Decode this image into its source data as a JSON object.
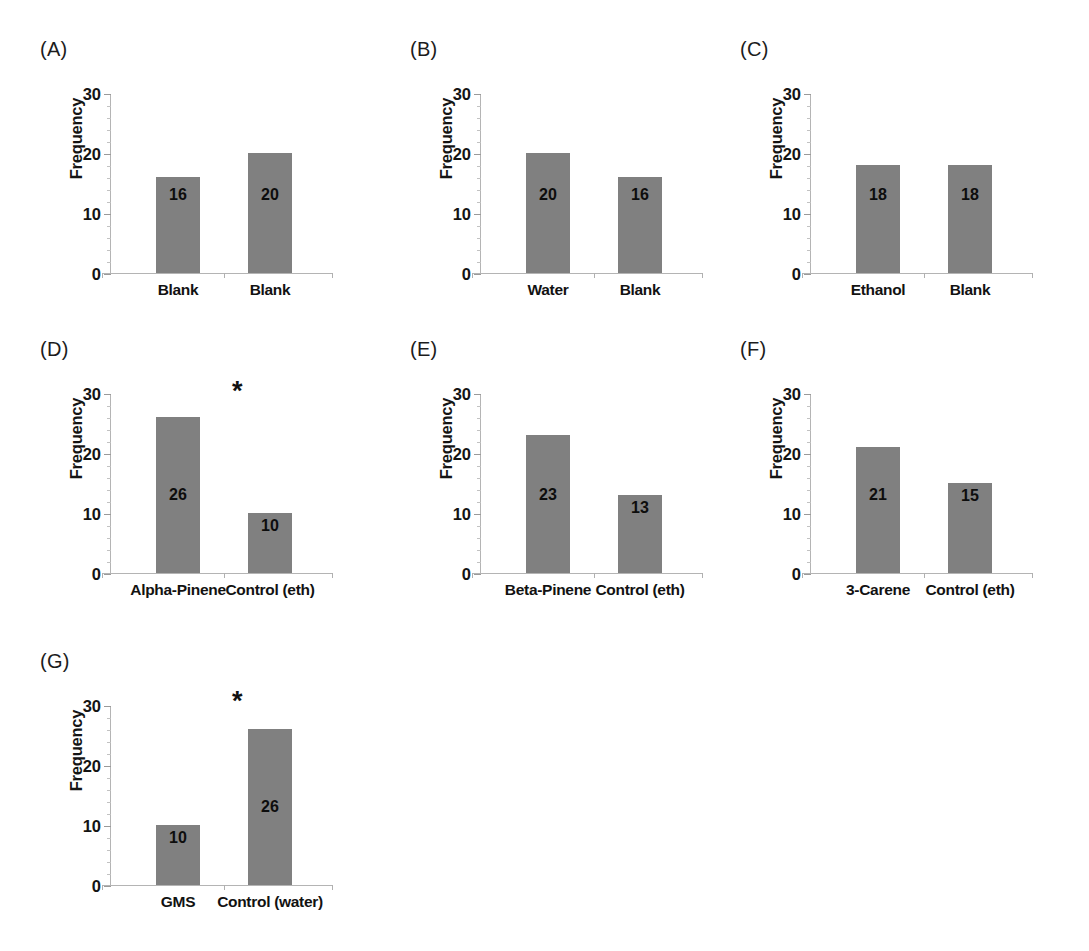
{
  "figure": {
    "axis_title": "Frequency",
    "y_ticks": [
      "0",
      "10",
      "20",
      "30"
    ],
    "significance_marker": "*",
    "bar_color": "#808080",
    "axis_color": "#b4b4b4",
    "text_color": "#121212"
  },
  "chart_data": [
    {
      "type": "bar",
      "panel": "(A)",
      "title": "",
      "xlabel": "",
      "ylabel": "Frequency",
      "categories": [
        "Blank",
        "Blank"
      ],
      "values": [
        16,
        20
      ],
      "ylim": [
        0,
        30
      ],
      "yticks": [
        0,
        10,
        20,
        30
      ],
      "grid": false,
      "legend": "none",
      "significant": false,
      "annotation": ""
    },
    {
      "type": "bar",
      "panel": "(B)",
      "title": "",
      "xlabel": "",
      "ylabel": "Frequency",
      "categories": [
        "Water",
        "Blank"
      ],
      "values": [
        20,
        16
      ],
      "ylim": [
        0,
        30
      ],
      "yticks": [
        0,
        10,
        20,
        30
      ],
      "grid": false,
      "legend": "none",
      "significant": false,
      "annotation": ""
    },
    {
      "type": "bar",
      "panel": "(C)",
      "title": "",
      "xlabel": "",
      "ylabel": "Frequency",
      "categories": [
        "Ethanol",
        "Blank"
      ],
      "values": [
        18,
        18
      ],
      "ylim": [
        0,
        30
      ],
      "yticks": [
        0,
        10,
        20,
        30
      ],
      "grid": false,
      "legend": "none",
      "significant": false,
      "annotation": ""
    },
    {
      "type": "bar",
      "panel": "(D)",
      "title": "",
      "xlabel": "",
      "ylabel": "Frequency",
      "categories": [
        "Alpha-Pinene",
        "Control (eth)"
      ],
      "values": [
        26,
        10
      ],
      "ylim": [
        0,
        30
      ],
      "yticks": [
        0,
        10,
        20,
        30
      ],
      "grid": false,
      "legend": "none",
      "significant": true,
      "annotation": "*"
    },
    {
      "type": "bar",
      "panel": "(E)",
      "title": "",
      "xlabel": "",
      "ylabel": "Frequency",
      "categories": [
        "Beta-Pinene",
        "Control (eth)"
      ],
      "values": [
        23,
        13
      ],
      "ylim": [
        0,
        30
      ],
      "yticks": [
        0,
        10,
        20,
        30
      ],
      "grid": false,
      "legend": "none",
      "significant": false,
      "annotation": ""
    },
    {
      "type": "bar",
      "panel": "(F)",
      "title": "",
      "xlabel": "",
      "ylabel": "Frequency",
      "categories": [
        "3-Carene",
        "Control (eth)"
      ],
      "values": [
        21,
        15
      ],
      "ylim": [
        0,
        30
      ],
      "yticks": [
        0,
        10,
        20,
        30
      ],
      "grid": false,
      "legend": "none",
      "significant": false,
      "annotation": ""
    },
    {
      "type": "bar",
      "panel": "(G)",
      "title": "",
      "xlabel": "",
      "ylabel": "Frequency",
      "categories": [
        "GMS",
        "Control (water)"
      ],
      "values": [
        10,
        26
      ],
      "ylim": [
        0,
        30
      ],
      "yticks": [
        0,
        10,
        20,
        30
      ],
      "grid": false,
      "legend": "none",
      "significant": true,
      "annotation": "*"
    }
  ]
}
